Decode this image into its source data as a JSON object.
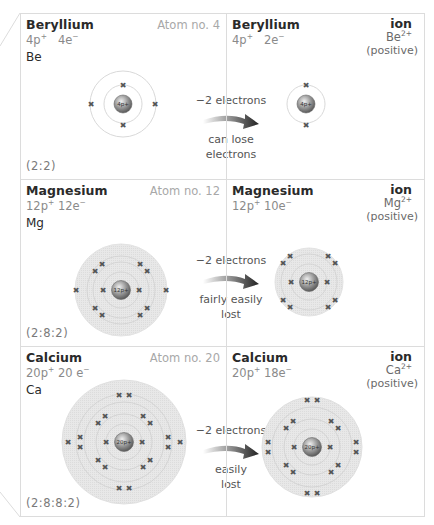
{
  "rows": [
    {
      "atom": {
        "name": "Beryllium",
        "atom_no": "Atom no. 4",
        "protons": "4p",
        "proton_sup": "+",
        "electrons": "4e",
        "electron_sup": "−",
        "symbol": "Be",
        "config": "(2:2)",
        "nucleus_label": "4p+",
        "shells": [
          2,
          2
        ]
      },
      "transition": {
        "change": "−2 electrons",
        "note_line1": "can lose",
        "note_line2": "electrons"
      },
      "ion": {
        "name": "Beryllium",
        "protons": "4p",
        "proton_sup": "+",
        "electrons": "2e",
        "electron_sup": "−",
        "label": "ion",
        "symbol": "Be",
        "charge_sup": "2+",
        "charge_type": "(positive)",
        "nucleus_label": "4p+",
        "shells": [
          2
        ]
      }
    },
    {
      "atom": {
        "name": "Magnesium",
        "atom_no": "Atom no. 12",
        "protons": "12p",
        "proton_sup": "+",
        "electrons": "12e",
        "electron_sup": "−",
        "symbol": "Mg",
        "config": "(2:8:2)",
        "nucleus_label": "12p+",
        "shells": [
          2,
          8,
          2
        ]
      },
      "transition": {
        "change": "−2 electrons",
        "note_line1": "fairly easily",
        "note_line2": "lost"
      },
      "ion": {
        "name": "Magnesium",
        "protons": "12p",
        "proton_sup": "+",
        "electrons": "10e",
        "electron_sup": "−",
        "label": "ion",
        "symbol": "Mg",
        "charge_sup": "2+",
        "charge_type": "(positive)",
        "nucleus_label": "12p+",
        "shells": [
          2,
          8
        ]
      }
    },
    {
      "atom": {
        "name": "Calcium",
        "atom_no": "Atom no. 20",
        "protons": "20p",
        "proton_sup": "+",
        "electrons": "20 e",
        "electron_sup": "−",
        "symbol": "Ca",
        "config": "(2:8:8:2)",
        "nucleus_label": "20p+",
        "shells": [
          2,
          8,
          8,
          2
        ]
      },
      "transition": {
        "change": "−2 electrons",
        "note_line1": "easily",
        "note_line2": "lost"
      },
      "ion": {
        "name": "Calcium",
        "protons": "20p",
        "proton_sup": "+",
        "electrons": "18e",
        "electron_sup": "−",
        "label": "ion",
        "symbol": "Ca",
        "charge_sup": "2+",
        "charge_type": "(positive)",
        "nucleus_label": "20p+",
        "shells": [
          2,
          8,
          8
        ]
      }
    }
  ],
  "colors": {
    "border": "#dcdcdc",
    "shell_fill": "#e6e6e6",
    "shell_line": "#cfcfcf",
    "electron": "#555555",
    "nucleus": "#8c8c8c",
    "arrow": "#333333",
    "muted_text": "#a8a8a8"
  }
}
